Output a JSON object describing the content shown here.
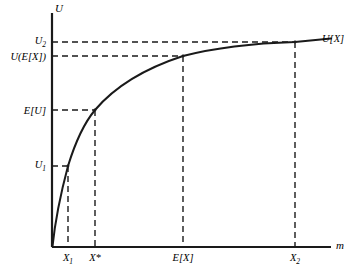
{
  "figure": {
    "background_color": "#ffffff",
    "ink_color": "#1a1a1a"
  },
  "axes": {
    "y_axis_name": "U",
    "x_axis_name": "m",
    "origin_label": ""
  },
  "curve_label": "U[X]",
  "y_ticks": [
    {
      "label_html": "U<sub>2</sub>",
      "label_text": "U2",
      "name": "y-tick-u2",
      "value": 42
    },
    {
      "label_html": "U(E[X])",
      "label_text": "U(E[X])",
      "name": "y-tick-u-of-ex",
      "value": 56
    },
    {
      "label_html": "E[U]",
      "label_text": "E[U]",
      "name": "y-tick-eu",
      "value": 110
    },
    {
      "label_html": "U<sub>1</sub>",
      "label_text": "U1",
      "name": "y-tick-u1",
      "value": 166
    }
  ],
  "x_ticks": [
    {
      "label_html": "X<sub>1</sub>",
      "label_text": "X1",
      "name": "x-tick-x1",
      "value": 68
    },
    {
      "label_html": "X*",
      "label_text": "X*",
      "name": "x-tick-xstar",
      "value": 95
    },
    {
      "label_html": "E[X]",
      "label_text": "E[X]",
      "name": "x-tick-ex",
      "value": 183
    },
    {
      "label_html": "X<sub>2</sub>",
      "label_text": "X2",
      "name": "x-tick-x2",
      "value": 295
    }
  ],
  "chart_data": {
    "type": "line",
    "title": "",
    "subtitle": "",
    "xlabel": "m",
    "ylabel": "U",
    "grid": false,
    "legend_position": "curve-end-right",
    "legend_entries": [
      "U[X]"
    ],
    "axis_style": "schematic-no-numeric-scale",
    "xlim": [
      0,
      1
    ],
    "ylim": [
      0,
      1
    ],
    "series": [
      {
        "name": "U[X]",
        "description": "concave increasing utility function of wealth",
        "x": [
          0.0,
          0.012,
          0.025,
          0.04,
          0.057,
          0.075,
          0.096,
          0.12,
          0.155,
          0.2,
          0.255,
          0.32,
          0.4,
          0.472,
          0.56,
          0.65,
          0.74,
          0.83,
          0.875,
          0.93,
          1.0
        ],
        "y": [
          0.0,
          0.092,
          0.175,
          0.25,
          0.318,
          0.38,
          0.44,
          0.495,
          0.56,
          0.625,
          0.688,
          0.746,
          0.8,
          0.832,
          0.866,
          0.895,
          0.918,
          0.938,
          0.946,
          0.956,
          0.97
        ]
      }
    ],
    "annotations": [
      {
        "name": "point-x1",
        "label": "(X1, U1)",
        "x_label": "X1",
        "y_label": "U1",
        "x": 0.057,
        "y": 0.318,
        "guides": [
          "horizontal-dashed-to-y-axis",
          "vertical-dashed-to-x-axis"
        ]
      },
      {
        "name": "point-xstar",
        "label": "(X*, E[U])",
        "x_label": "X*",
        "y_label": "E[U]",
        "x": 0.155,
        "y": 0.56,
        "guides": [
          "horizontal-dashed-to-y-axis",
          "vertical-dashed-to-x-axis"
        ]
      },
      {
        "name": "point-ex",
        "label": "(E[X], U(E[X]))",
        "x_label": "E[X]",
        "y_label": "U(E[X])",
        "x": 0.472,
        "y": 0.832,
        "guides": [
          "horizontal-dashed-to-y-axis",
          "vertical-dashed-to-x-axis"
        ]
      },
      {
        "name": "point-x2",
        "label": "(X2, U2)",
        "x_label": "X2",
        "y_label": "U2",
        "x": 0.875,
        "y": 0.946,
        "guides": [
          "horizontal-dashed-to-y-axis",
          "vertical-dashed-to-x-axis"
        ]
      }
    ],
    "chord": {
      "name": "chord-x1-x2",
      "description": "straight dashed/solid segment joining (X1,U1) and (X2,U2) passing through (X*, E[U])",
      "from": [
        0.057,
        0.318
      ],
      "to": [
        0.875,
        0.946
      ],
      "visible": false
    }
  }
}
